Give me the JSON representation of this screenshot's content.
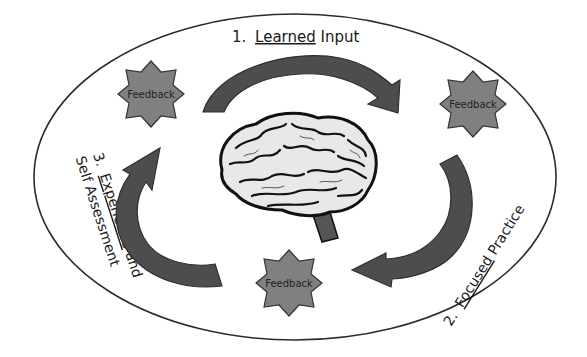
{
  "diagram": {
    "type": "learning-cycle",
    "colors": {
      "background": "#ffffff",
      "ellipse_stroke": "#2b2b2b",
      "arrow_fill": "#4d4d4d",
      "arrow_stroke": "#2e2e2e",
      "star_fill": "#808080",
      "star_stroke": "#333333",
      "text": "#1a1a1a"
    },
    "center_icon": "brain-illustration",
    "stages": [
      {
        "number": "1.",
        "emphasis": "Learned",
        "rest": " Input"
      },
      {
        "number": "2.",
        "emphasis": "Focused",
        "rest": " Practice"
      },
      {
        "number": "3.",
        "emphasis": "Experience",
        "rest": " and",
        "line2": "Self Assessment"
      }
    ],
    "feedback_nodes": [
      {
        "label": "Feedback",
        "position": "top-left"
      },
      {
        "label": "Feedback",
        "position": "top-right"
      },
      {
        "label": "Feedback",
        "position": "bottom"
      }
    ]
  }
}
